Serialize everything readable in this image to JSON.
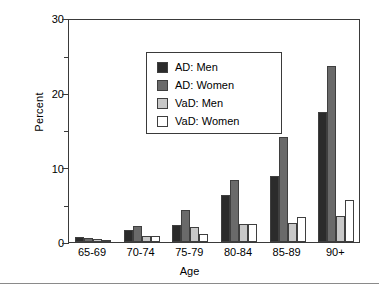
{
  "chart_data": {
    "type": "bar",
    "title": "",
    "xlabel": "Age",
    "ylabel": "Percent",
    "categories": [
      "65-69",
      "70-74",
      "75-79",
      "80-84",
      "85-89",
      "90+"
    ],
    "series": [
      {
        "name": "AD: Men",
        "color": "#2b2b2b",
        "values": [
          0.7,
          1.6,
          2.3,
          6.3,
          8.8,
          17.4
        ]
      },
      {
        "name": "AD: Women",
        "color": "#6a6a6a",
        "values": [
          0.5,
          2.2,
          4.3,
          8.3,
          14.0,
          23.6
        ]
      },
      {
        "name": "VaD: Men",
        "color": "#c8c8c8",
        "values": [
          0.4,
          0.85,
          2.0,
          2.4,
          2.5,
          3.5
        ]
      },
      {
        "name": "VaD: Women",
        "color": "#ffffff",
        "values": [
          0.3,
          0.8,
          1.1,
          2.4,
          3.3,
          5.6
        ]
      }
    ],
    "ylim": [
      0,
      30
    ],
    "y_major_ticks": [
      0,
      10,
      20,
      30
    ],
    "y_minor_ticks": [
      5,
      15,
      25
    ],
    "y_tick_labels": [
      "0",
      "10",
      "20",
      "30"
    ],
    "grid": false,
    "legend_position": "upper left",
    "legend_entries": [
      "AD: Men",
      "AD: Women",
      "VaD: Men",
      "VaD: Women"
    ]
  }
}
